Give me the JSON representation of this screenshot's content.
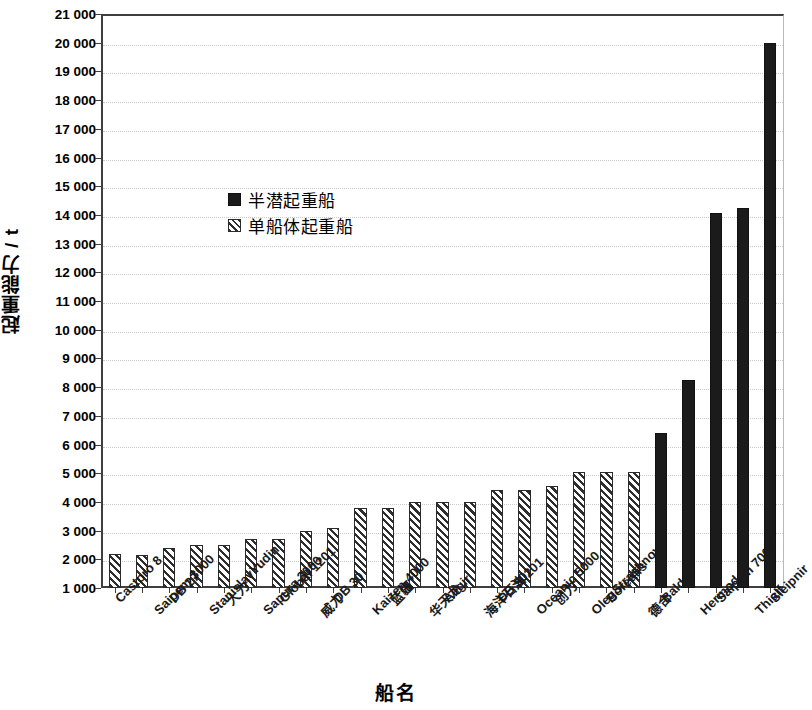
{
  "chart_data": {
    "type": "bar",
    "title": "",
    "xlabel": "船名",
    "ylabel": "起重能力 / t",
    "ylim": [
      1000,
      21000
    ],
    "ytick_step": 1000,
    "grid": true,
    "legend_position": "inside-upper-left",
    "ytick_labels": [
      "21 000",
      "20 000",
      "19 000",
      "18 000",
      "17 000",
      "16 000",
      "15 000",
      "14 000",
      "13 000",
      "12 000",
      "11 000",
      "10 000",
      "9 000",
      "8 000",
      "7 000",
      "6 000",
      "5 000",
      "4 000",
      "3 000",
      "2 000",
      "1 000"
    ],
    "ytick_values": [
      21000,
      20000,
      19000,
      18000,
      17000,
      16000,
      15000,
      14000,
      13000,
      12000,
      11000,
      10000,
      9000,
      8000,
      7000,
      6000,
      5000,
      4000,
      3000,
      2000,
      1000
    ],
    "categories": [
      "Castoro 8",
      "Saipem 3000",
      "DB 27",
      "StanislavYudin",
      "大力",
      "Sapura 3000",
      "Global 1201",
      "威力",
      "DB 30",
      "Kaizen 4000",
      "蓝疆",
      "华天龙",
      "Aegir",
      "海洋石油 201",
      "DB 50",
      "Oceanic 5000",
      "创力",
      "OlegStrashnov",
      "Borealis",
      "德合",
      "Balder",
      "Hermod",
      "Saipem 7000",
      "Thialf",
      "Sleipnir"
    ],
    "values": [
      2200,
      2150,
      2400,
      2500,
      2500,
      2700,
      2700,
      3000,
      3100,
      3800,
      3800,
      4000,
      4000,
      4000,
      4400,
      4400,
      4550,
      5050,
      5050,
      5050,
      6400,
      8250,
      14050,
      14250,
      20000
    ],
    "series_of_bar": [
      "monohull",
      "monohull",
      "monohull",
      "monohull",
      "monohull",
      "monohull",
      "monohull",
      "monohull",
      "monohull",
      "monohull",
      "monohull",
      "monohull",
      "monohull",
      "monohull",
      "monohull",
      "monohull",
      "monohull",
      "monohull",
      "monohull",
      "monohull",
      "semisub",
      "semisub",
      "semisub",
      "semisub",
      "semisub"
    ],
    "series": [
      {
        "key": "semisub",
        "name": "半潜起重船",
        "style": "solid",
        "color": "#1b1b1b"
      },
      {
        "key": "monohull",
        "name": "单船体起重船",
        "style": "hatched",
        "color": "#2e2e2e"
      }
    ]
  }
}
